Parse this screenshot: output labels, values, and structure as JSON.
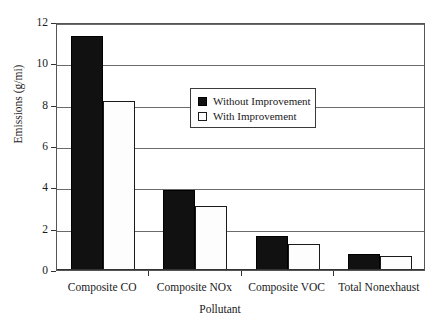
{
  "chart_data": {
    "type": "bar",
    "title": "",
    "xlabel": "Pollutant",
    "ylabel": "Emissions (g/mi)",
    "categories": [
      "Composite CO",
      "Composite NOx",
      "Composite VOC",
      "Total Nonexhaust"
    ],
    "series": [
      {
        "name": "Without Improvement",
        "values": [
          11.3,
          3.85,
          1.65,
          0.78
        ],
        "color": "#111111"
      },
      {
        "name": "With Improvement",
        "values": [
          8.2,
          3.1,
          1.25,
          0.68
        ],
        "color": "#fdfdfd"
      }
    ],
    "ylim": [
      0,
      12
    ],
    "yticks": [
      0,
      2,
      4,
      6,
      8,
      10,
      12
    ],
    "ytick_labels": [
      "0",
      "2",
      "4",
      "6",
      "8",
      "10",
      "12"
    ],
    "grid": true,
    "legend_position": "upper center"
  },
  "legend": {
    "entries": [
      {
        "label": "Without Improvement"
      },
      {
        "label": "With Improvement"
      }
    ]
  }
}
